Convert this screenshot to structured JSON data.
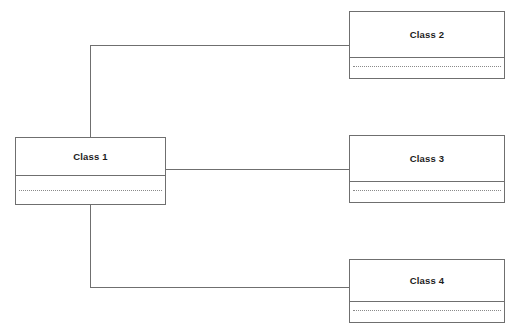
{
  "diagram": {
    "type": "uml-class-diagram",
    "background_color": "#ffffff",
    "line_color": "#6f6f6f",
    "text_color": "#1c1c1c",
    "classes": [
      {
        "id": "class-1",
        "name": "Class 1",
        "attributes": [],
        "operations": []
      },
      {
        "id": "class-2",
        "name": "Class 2",
        "attributes": [],
        "operations": []
      },
      {
        "id": "class-3",
        "name": "Class 3",
        "attributes": [],
        "operations": []
      },
      {
        "id": "class-4",
        "name": "Class 4",
        "attributes": [],
        "operations": []
      }
    ],
    "associations": [
      {
        "id": "assoc-1-2",
        "from": "class-1",
        "to": "class-2",
        "style": "orthogonal"
      },
      {
        "id": "assoc-1-3",
        "from": "class-1",
        "to": "class-3",
        "style": "straight"
      },
      {
        "id": "assoc-1-4",
        "from": "class-1",
        "to": "class-4",
        "style": "orthogonal"
      }
    ]
  }
}
